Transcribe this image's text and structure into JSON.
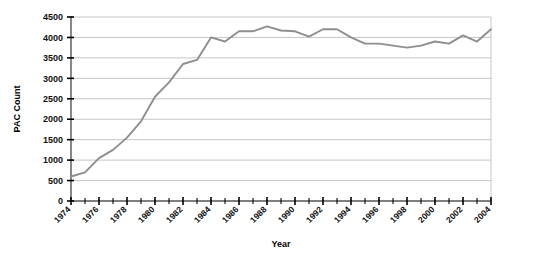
{
  "chart_data": {
    "type": "line",
    "title": "",
    "xlabel": "Year",
    "ylabel": "PAC Count",
    "xlim": [
      1974,
      2004
    ],
    "ylim": [
      0,
      4500
    ],
    "grid": true,
    "legend": false,
    "line_color": "#8e8e8e",
    "y_ticks": [
      0,
      500,
      1000,
      1500,
      2000,
      2500,
      3000,
      3500,
      4000,
      4500
    ],
    "y_tick_labels": [
      "0",
      "500",
      "1000",
      "1500",
      "2000",
      "2500",
      "3000",
      "3500",
      "4000",
      "4500"
    ],
    "x_ticks": [
      1974,
      1975,
      1976,
      1977,
      1978,
      1979,
      1980,
      1981,
      1982,
      1983,
      1984,
      1985,
      1986,
      1987,
      1988,
      1989,
      1990,
      1991,
      1992,
      1993,
      1994,
      1995,
      1996,
      1997,
      1998,
      1999,
      2000,
      2001,
      2002,
      2003,
      2004
    ],
    "x_tick_labels": [
      "1974",
      "1976",
      "1978",
      "1980",
      "1982",
      "1984",
      "1986",
      "1988",
      "1990",
      "1992",
      "1994",
      "1996",
      "1998",
      "2000",
      "2002",
      "2004"
    ],
    "x_labeled_years": [
      1974,
      1976,
      1978,
      1980,
      1982,
      1984,
      1986,
      1988,
      1990,
      1992,
      1994,
      1996,
      1998,
      2000,
      2002,
      2004
    ],
    "x": [
      1974,
      1975,
      1976,
      1977,
      1978,
      1979,
      1980,
      1981,
      1982,
      1983,
      1984,
      1985,
      1986,
      1987,
      1988,
      1989,
      1990,
      1991,
      1992,
      1993,
      1994,
      1995,
      1996,
      1997,
      1998,
      1999,
      2000,
      2001,
      2002,
      2003,
      2004
    ],
    "values": [
      600,
      700,
      1050,
      1250,
      1550,
      1950,
      2550,
      2900,
      3350,
      3450,
      4000,
      3900,
      4150,
      4150,
      4270,
      4170,
      4150,
      4020,
      4200,
      4200,
      4000,
      3850,
      3850,
      3800,
      3750,
      3800,
      3900,
      3850,
      4050,
      3900,
      4200
    ]
  },
  "axes": {
    "y_axis_title": "PAC Count",
    "x_axis_title": "Year"
  }
}
